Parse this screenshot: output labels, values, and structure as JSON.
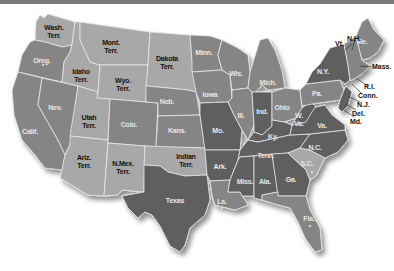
{
  "colors": {
    "light_territory": "#a8a8a8",
    "medium_state": "#858585",
    "dark_state": "#5e5e5e",
    "darkest_state": "#4a4a4a",
    "border": "#e9e9e9",
    "topbar": "#7a7a7a"
  },
  "regions": [
    {
      "id": "wash",
      "label": "Wash.\nTerr.",
      "type": "territory"
    },
    {
      "id": "oreg",
      "label": "Oreg.",
      "type": "state"
    },
    {
      "id": "calif",
      "label": "Calif.",
      "type": "state"
    },
    {
      "id": "nev",
      "label": "Nev.",
      "type": "state"
    },
    {
      "id": "idaho",
      "label": "Idaho\nTerr.",
      "type": "territory"
    },
    {
      "id": "mont",
      "label": "Mont.\nTerr.",
      "type": "territory"
    },
    {
      "id": "wyo",
      "label": "Wyo.\nTerr.",
      "type": "territory"
    },
    {
      "id": "utah",
      "label": "Utah\nTerr.",
      "type": "territory"
    },
    {
      "id": "ariz",
      "label": "Ariz.\nTerr.",
      "type": "territory"
    },
    {
      "id": "colo",
      "label": "Colo.",
      "type": "state"
    },
    {
      "id": "nmex",
      "label": "N.Mex.\nTerr.",
      "type": "territory"
    },
    {
      "id": "dakota",
      "label": "Dakota\nTerr.",
      "type": "territory"
    },
    {
      "id": "neb",
      "label": "Neb.",
      "type": "state"
    },
    {
      "id": "kans",
      "label": "Kans.",
      "type": "state"
    },
    {
      "id": "indian",
      "label": "Indian\nTerr.",
      "type": "territory"
    },
    {
      "id": "texas",
      "label": "Texas",
      "type": "state"
    },
    {
      "id": "minn",
      "label": "Minn.",
      "type": "state"
    },
    {
      "id": "iowa",
      "label": "Iowa",
      "type": "state"
    },
    {
      "id": "mo",
      "label": "Mo.",
      "type": "state"
    },
    {
      "id": "ark",
      "label": "Ark.",
      "type": "state"
    },
    {
      "id": "la",
      "label": "La.",
      "type": "state"
    },
    {
      "id": "wis",
      "label": "Wis.",
      "type": "state"
    },
    {
      "id": "ill",
      "label": "Ill.",
      "type": "state"
    },
    {
      "id": "mich",
      "label": "Mich.",
      "type": "state"
    },
    {
      "id": "ind",
      "label": "Ind.",
      "type": "state"
    },
    {
      "id": "ohio",
      "label": "Ohio",
      "type": "state"
    },
    {
      "id": "ky",
      "label": "Ky.",
      "type": "state"
    },
    {
      "id": "tenn",
      "label": "Tenn.",
      "type": "state"
    },
    {
      "id": "miss",
      "label": "Miss.",
      "type": "state"
    },
    {
      "id": "ala",
      "label": "Ala.",
      "type": "state"
    },
    {
      "id": "ga",
      "label": "Ga.",
      "type": "state"
    },
    {
      "id": "fla",
      "label": "Fla.",
      "type": "state"
    },
    {
      "id": "sc",
      "label": "S.C.",
      "type": "state"
    },
    {
      "id": "nc",
      "label": "N.C.",
      "type": "state"
    },
    {
      "id": "va",
      "label": "Va.",
      "type": "state"
    },
    {
      "id": "wva",
      "label": "W.\nVa.",
      "type": "state"
    },
    {
      "id": "pa",
      "label": "Pa.",
      "type": "state"
    },
    {
      "id": "ny",
      "label": "N.Y.",
      "type": "state"
    },
    {
      "id": "me",
      "label": "Me.",
      "type": "state"
    }
  ],
  "callouts": [
    {
      "id": "vt",
      "label": "Vt."
    },
    {
      "id": "nh",
      "label": "N.H."
    },
    {
      "id": "mass",
      "label": "Mass."
    },
    {
      "id": "ri",
      "label": "R.I."
    },
    {
      "id": "conn",
      "label": "Conn."
    },
    {
      "id": "nj",
      "label": "N.J."
    },
    {
      "id": "del",
      "label": "Del."
    },
    {
      "id": "md",
      "label": "Md."
    }
  ]
}
